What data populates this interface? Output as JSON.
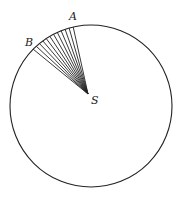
{
  "diagram": {
    "circle": {
      "cx": 91,
      "cy": 106,
      "r": 81,
      "stroke": "#222222"
    },
    "focus": {
      "label": "S",
      "x": 88,
      "y": 94
    },
    "arc_start": {
      "label": "A"
    },
    "arc_end": {
      "label": "B"
    },
    "line_count": 12
  }
}
